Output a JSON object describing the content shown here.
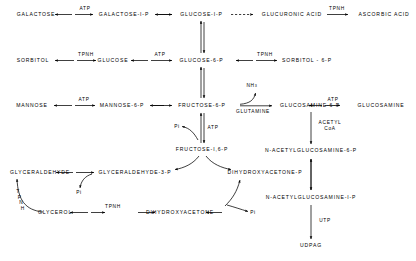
{
  "diagram": {
    "type": "biochemical-pathway",
    "nodes": {
      "galactose": "GALACTOSE",
      "galactose_1_p": "GALACTOSE-I-P",
      "glucose_1_p": "GLUCOSE-I-P",
      "glucuronic_acid": "GLUCURONIC  ACID",
      "ascorbic_acid": "ASCORBIC  ACID",
      "sorbitol": "SORBITOL",
      "glucose": "GLUCOSE",
      "glucose_6_p": "GLUCOSE-6-P",
      "sorbitol_6_p": "SORBITOL - 6-P",
      "mannose": "MANNOSE",
      "mannose_6_p": "MANNOSE-6-P",
      "fructose_6_p": "FRUCTOSE-6-P",
      "glucosamine_6_p": "GLUCOSAMINE-6-P",
      "glucosamine": "GLUCOSAMINE",
      "fructose_1_6_p": "FRUCTOSE-I,6-P",
      "n_acetylglucosamine_6_p": "N-ACETYLGLUCOSAMINE-6-P",
      "glyceraldehyde": "GLYCERALDEHYDE",
      "glyceraldehyde_3_p": "GLYCERALDEHYDE-3-P",
      "dihydroxyacetone_p": "DIHYDROXYACETONE-P",
      "n_acetylglucosamine_1_p": "N-ACETYLGLUCOSAMINE-I-P",
      "glycerol": "GLYCEROL",
      "dihydroxyacetone": "DIHYDROXYACETONE",
      "udpag": "UDPAG"
    },
    "edge_labels": {
      "atp_galactose": "ATP",
      "tpnh_ascorbic": "TPNH",
      "tpnh_sorbitol": "TPNH",
      "atp_glucose": "ATP",
      "tpnh_sorbitol_6p": "TPNH",
      "atp_mannose": "ATP",
      "glutamine": "GLUTAMINE",
      "atp_glucosamine": "ATP",
      "atp_fructose": "ATP",
      "pi_fructose": "Pi",
      "acetyl_coa_line1": "ACETYL",
      "acetyl_coa_line2": "CoA",
      "pi_glyceraldehyde": "Pi",
      "pi_dihydroxyacetone": "Pi",
      "tpnh_glycerol": "TPNH",
      "utp": "UTP"
    },
    "cofactors": {
      "ammonia_prefix": "NH",
      "ammonia_subscript": "3",
      "tpnh_vertical": "TPNH"
    },
    "colors": {
      "ink": "#000000",
      "background": "#ffffff"
    }
  }
}
